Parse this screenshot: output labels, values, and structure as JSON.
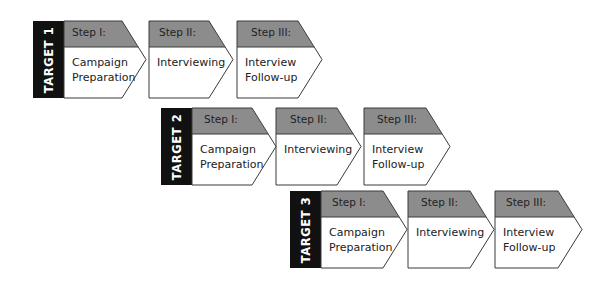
{
  "colors": {
    "header_fill": "#8c8c8c",
    "target_fill": "#111111",
    "border": "#3a3a3a",
    "body_fill": "#ffffff"
  },
  "rows": [
    {
      "target": "TARGET 1",
      "steps": [
        {
          "head": "Step I:",
          "body": [
            "Campaign",
            "Preparation"
          ]
        },
        {
          "head": "Step II:",
          "body": [
            "Interviewing"
          ]
        },
        {
          "head": "Step III:",
          "body": [
            "Interview",
            "Follow-up"
          ]
        }
      ]
    },
    {
      "target": "TARGET 2",
      "steps": [
        {
          "head": "Step I:",
          "body": [
            "Campaign",
            "Preparation"
          ]
        },
        {
          "head": "Step II:",
          "body": [
            "Interviewing"
          ]
        },
        {
          "head": "Step III:",
          "body": [
            "Interview",
            "Follow-up"
          ]
        }
      ]
    },
    {
      "target": "TARGET 3",
      "steps": [
        {
          "head": "Step I:",
          "body": [
            "Campaign",
            "Preparation"
          ]
        },
        {
          "head": "Step II:",
          "body": [
            "Interviewing"
          ]
        },
        {
          "head": "Step III:",
          "body": [
            "Interview",
            "Follow-up"
          ]
        }
      ]
    }
  ]
}
